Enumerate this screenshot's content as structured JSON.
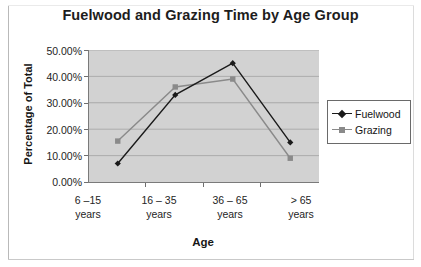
{
  "chart_data": {
    "type": "line",
    "title": "Fuelwood and Grazing Time by Age Group",
    "xlabel": "Age",
    "ylabel": "Percentage of Total",
    "categories": [
      "6 –15\nyears",
      "16 – 35\nyears",
      "36 – 65\nyears",
      "> 65\nyears"
    ],
    "category_lines": [
      [
        "6 –15",
        "years"
      ],
      [
        "16 – 35",
        "years"
      ],
      [
        "36 – 65",
        "years"
      ],
      [
        "> 65",
        "years"
      ]
    ],
    "ylim": [
      0,
      50
    ],
    "ytick_values": [
      50,
      40,
      30,
      20,
      10,
      0
    ],
    "ytick_labels": [
      "50.00%",
      "40.00%",
      "30.00%",
      "20.00%",
      "10.00%",
      "0.00%"
    ],
    "grid": true,
    "legend_position": "right",
    "series": [
      {
        "name": "Fuelwood",
        "marker": "diamond",
        "color": "#1a1a1a",
        "values": [
          7.0,
          33.0,
          45.0,
          15.0
        ]
      },
      {
        "name": "Grazing",
        "marker": "square",
        "color": "#8a8a8a",
        "values": [
          15.5,
          36.0,
          39.0,
          9.0
        ]
      }
    ],
    "plot_background": "#d2d2d2",
    "gridline_color": "#a8a8a8",
    "axis_color": "#7a7a7a"
  }
}
